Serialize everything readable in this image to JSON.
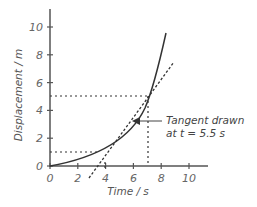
{
  "chart_data": {
    "type": "line",
    "title": "",
    "xlabel": "Time / s",
    "ylabel": "Displacement / m",
    "xlim": [
      0,
      11.5
    ],
    "ylim": [
      0,
      11.5
    ],
    "x_ticks": [
      "0",
      "2",
      "4",
      "6",
      "8",
      "10"
    ],
    "y_ticks": [
      "0",
      "2",
      "4",
      "6",
      "8",
      "10"
    ],
    "grid": false,
    "series": [
      {
        "name": "displacement curve",
        "style": "solid",
        "x": [
          0,
          1,
          2,
          3,
          4,
          5,
          5.5,
          6,
          7,
          8,
          8.3
        ],
        "y": [
          0,
          0.15,
          0.4,
          0.8,
          1.5,
          2.5,
          3.1,
          3.8,
          5.5,
          8.3,
          9.6
        ]
      },
      {
        "name": "tangent",
        "style": "dashed",
        "x": [
          2.8,
          8.9
        ],
        "y": [
          -0.8,
          7.4
        ]
      }
    ],
    "guides": [
      {
        "type": "horizontal",
        "y": 5,
        "x_from": 0,
        "x_to": 7
      },
      {
        "type": "vertical",
        "x": 7,
        "y_from": 0,
        "y_to": 5
      },
      {
        "type": "horizontal",
        "y": 1,
        "x_from": 0,
        "x_to": 3.4
      },
      {
        "type": "vertical",
        "x": 4,
        "y_from": -0.3,
        "y_to": 0.3
      }
    ],
    "annotation": {
      "line1": "Tangent drawn",
      "line2": "at t = 5.5 s",
      "points_to": [
        5.5,
        3.1
      ]
    }
  }
}
